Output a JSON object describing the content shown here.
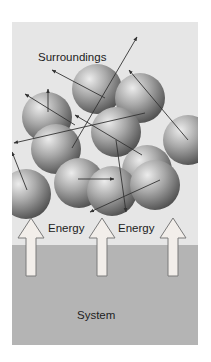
{
  "diagram": {
    "labels": {
      "surroundings": "Surroundings",
      "energy_left": "Energy",
      "energy_right": "Energy",
      "system": "System"
    },
    "colors": {
      "background": "#ffffff",
      "surroundings_fill": "#e6e6e6",
      "system_fill": "#b4b4b4",
      "sphere_light": "#e8e8e8",
      "sphere_dark": "#5a5a5a",
      "motion_arrow": "#333333",
      "energy_arrow_fill": "#f2eeea",
      "energy_arrow_stroke": "#7a7a7a"
    },
    "regions": [
      {
        "name": "surroundings",
        "x": 12,
        "y": 22,
        "w": 186,
        "h": 223
      },
      {
        "name": "system",
        "x": 12,
        "y": 245,
        "w": 186,
        "h": 100
      }
    ],
    "spheres": [
      {
        "cx": 47,
        "cy": 117,
        "r": 25
      },
      {
        "cx": 97,
        "cy": 89,
        "r": 25
      },
      {
        "cx": 140,
        "cy": 98,
        "r": 25
      },
      {
        "cx": 56,
        "cy": 149,
        "r": 25
      },
      {
        "cx": 116,
        "cy": 132,
        "r": 25
      },
      {
        "cx": 188,
        "cy": 140,
        "r": 25
      },
      {
        "cx": 79,
        "cy": 183,
        "r": 25
      },
      {
        "cx": 147,
        "cy": 170,
        "r": 25
      },
      {
        "cx": 26,
        "cy": 194,
        "r": 25
      },
      {
        "cx": 112,
        "cy": 191,
        "r": 25
      },
      {
        "cx": 155,
        "cy": 185,
        "r": 25
      }
    ],
    "motion_arrows": [
      {
        "x1": 48,
        "y1": 112,
        "x2": 48,
        "y2": 89
      },
      {
        "x1": 105,
        "y1": 98,
        "x2": 52,
        "y2": 70
      },
      {
        "x1": 72,
        "y1": 148,
        "x2": 137,
        "y2": 37
      },
      {
        "x1": 75,
        "y1": 125,
        "x2": 25,
        "y2": 94
      },
      {
        "x1": 188,
        "y1": 140,
        "x2": 129,
        "y2": 70
      },
      {
        "x1": 145,
        "y1": 113,
        "x2": 14,
        "y2": 143
      },
      {
        "x1": 142,
        "y1": 155,
        "x2": 75,
        "y2": 115
      },
      {
        "x1": 27,
        "y1": 190,
        "x2": 12,
        "y2": 152
      },
      {
        "x1": 78,
        "y1": 179,
        "x2": 114,
        "y2": 179
      },
      {
        "x1": 116,
        "y1": 140,
        "x2": 126,
        "y2": 212
      },
      {
        "x1": 160,
        "y1": 180,
        "x2": 90,
        "y2": 212
      }
    ],
    "energy_arrows": [
      {
        "cx": 31,
        "tip_y": 218,
        "head_base_y": 238,
        "bottom_y": 276,
        "head_half": 13,
        "shaft_half": 5
      },
      {
        "cx": 102,
        "tip_y": 218,
        "head_base_y": 238,
        "bottom_y": 276,
        "head_half": 13,
        "shaft_half": 5
      },
      {
        "cx": 173,
        "tip_y": 218,
        "head_base_y": 238,
        "bottom_y": 276,
        "head_half": 13,
        "shaft_half": 5
      }
    ]
  }
}
